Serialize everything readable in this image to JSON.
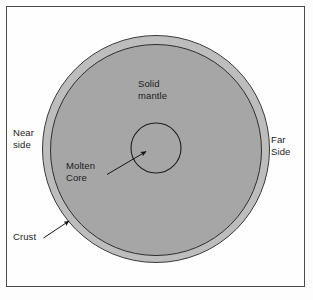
{
  "figure": {
    "background_color": "#fdfdfd",
    "frame_color": "#4a4a4a"
  },
  "diagram": {
    "type": "cross-section",
    "layers": [
      {
        "id": "crust",
        "label": "Crust",
        "shape": "outer-ring",
        "fill_color": "#bdbdbd",
        "stroke_color": "#3a3a3a",
        "center": [
          156,
          149
        ],
        "radius": 114
      },
      {
        "id": "solid-mantle",
        "label": "Solid\nmantle",
        "shape": "circle",
        "fill_color": "#a6a6a6",
        "stroke_color": "#2e2e2e",
        "center": [
          156,
          150
        ],
        "radius": 106
      },
      {
        "id": "molten-core",
        "label": "Molten\nCore",
        "shape": "circle",
        "fill_color": "#a6a6a6",
        "stroke_color": "#222222",
        "center": [
          156,
          148
        ],
        "radius": 25
      }
    ],
    "orientation_labels": [
      {
        "id": "near-side",
        "label": "Near\nside",
        "position": "left"
      },
      {
        "id": "far-side",
        "label": "Far\nSide",
        "position": "right"
      }
    ],
    "callouts": [
      {
        "id": "molten-core-callout",
        "label": "Molten\nCore",
        "from": [
          107,
          174
        ],
        "to": [
          147,
          151
        ],
        "arrowhead": "end"
      },
      {
        "id": "crust-callout",
        "label": "Crust",
        "from": [
          44,
          238
        ],
        "to": [
          70,
          221
        ],
        "arrowhead": "end"
      }
    ]
  },
  "labels": {
    "near_side": "Near\nside",
    "far_side": "Far\nSide",
    "solid_mantle": "Solid\nmantle",
    "molten_core": "Molten\nCore",
    "crust": "Crust"
  }
}
